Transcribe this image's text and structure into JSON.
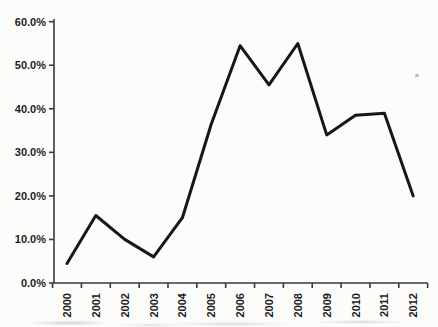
{
  "figure": {
    "background": "#fcfcfb",
    "axis_color": "#3a3a3a",
    "label_color": "#1c1c1c"
  },
  "chart_data": {
    "type": "line",
    "title": "",
    "xlabel": "",
    "ylabel": "",
    "x": [
      2000,
      2001,
      2002,
      2003,
      2004,
      2005,
      2006,
      2007,
      2008,
      2009,
      2010,
      2011,
      2012
    ],
    "values": [
      4.5,
      15.5,
      10,
      6,
      15,
      36.5,
      54.5,
      45.5,
      55,
      34,
      38.5,
      39,
      20
    ],
    "value_unit": "percent",
    "ylim": [
      0,
      60
    ],
    "y_tick_step": 10,
    "y_tick_labels": [
      "0.0%",
      "10.0%",
      "20.0%",
      "30.0%",
      "40.0%",
      "50.0%",
      "60.0%"
    ],
    "x_tick_labels": [
      "2000",
      "2001",
      "2002",
      "2003",
      "2004",
      "2005",
      "2006",
      "2007",
      "2008",
      "2009",
      "2010",
      "2011",
      "2012"
    ],
    "x_label_rotation": -90,
    "grid": false,
    "legend": false,
    "line_color": "#171717",
    "line_width": 3
  }
}
